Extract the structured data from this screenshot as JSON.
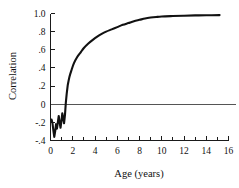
{
  "chart_data": {
    "type": "line",
    "title": "",
    "xlabel": "Age (years)",
    "ylabel": "Correlation",
    "xlim": [
      0,
      16
    ],
    "ylim": [
      -0.4,
      1.0
    ],
    "grid": false,
    "legend": null,
    "x_ticks": [
      0,
      2,
      4,
      6,
      8,
      10,
      12,
      14,
      16
    ],
    "x_tick_labels": [
      "0",
      "2",
      "4",
      "6",
      "8",
      "10",
      "12",
      "14",
      "16"
    ],
    "x_minor_ticks": [
      1,
      3,
      5,
      7,
      9,
      11,
      13,
      15
    ],
    "y_ticks": [
      -0.4,
      -0.2,
      0,
      0.2,
      0.4,
      0.6,
      0.8,
      1.0
    ],
    "y_tick_labels": [
      "-.4",
      "-.2",
      "0",
      ".2",
      ".4",
      ".6",
      ".8",
      "1.0"
    ],
    "reference_lines": [
      {
        "name": "zero-correlation",
        "axis": "y",
        "value": 0,
        "color": "#555555"
      }
    ],
    "series": [
      {
        "name": "correlation-with-adult-iq",
        "color": "#111111",
        "points": [
          [
            0.1,
            -0.17
          ],
          [
            0.18,
            -0.21
          ],
          [
            0.26,
            -0.29
          ],
          [
            0.34,
            -0.36
          ],
          [
            0.42,
            -0.3
          ],
          [
            0.5,
            -0.22
          ],
          [
            0.58,
            -0.27
          ],
          [
            0.66,
            -0.2
          ],
          [
            0.74,
            -0.13
          ],
          [
            0.82,
            -0.2
          ],
          [
            0.9,
            -0.26
          ],
          [
            0.98,
            -0.19
          ],
          [
            1.06,
            -0.1
          ],
          [
            1.14,
            -0.15
          ],
          [
            1.22,
            -0.21
          ],
          [
            1.3,
            -0.12
          ],
          [
            1.38,
            0.02
          ],
          [
            1.46,
            0.12
          ],
          [
            1.55,
            0.21
          ],
          [
            1.7,
            0.3
          ],
          [
            1.9,
            0.38
          ],
          [
            2.1,
            0.45
          ],
          [
            2.4,
            0.52
          ],
          [
            2.7,
            0.57
          ],
          [
            3.0,
            0.62
          ],
          [
            3.4,
            0.67
          ],
          [
            3.8,
            0.71
          ],
          [
            4.2,
            0.745
          ],
          [
            4.6,
            0.775
          ],
          [
            5.0,
            0.8
          ],
          [
            5.5,
            0.825
          ],
          [
            6.0,
            0.85
          ],
          [
            6.5,
            0.875
          ],
          [
            7.0,
            0.895
          ],
          [
            7.5,
            0.915
          ],
          [
            8.0,
            0.93
          ],
          [
            8.5,
            0.945
          ],
          [
            9.0,
            0.955
          ],
          [
            9.5,
            0.962
          ],
          [
            10.0,
            0.967
          ],
          [
            11.0,
            0.972
          ],
          [
            12.0,
            0.976
          ],
          [
            13.0,
            0.979
          ],
          [
            14.0,
            0.981
          ],
          [
            15.2,
            0.982
          ]
        ]
      }
    ]
  },
  "axes": {
    "x_title": "Age (years)",
    "y_title": "Correlation"
  }
}
